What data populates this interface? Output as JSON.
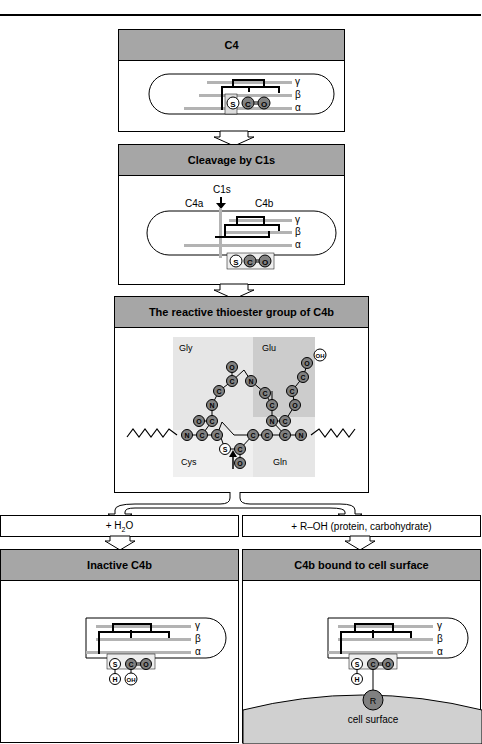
{
  "panels": {
    "c4": {
      "title": "C4"
    },
    "cleavage": {
      "title": "Cleavage by C1s",
      "labels": {
        "enzyme": "C1s",
        "fragment_a": "C4a",
        "fragment_b": "C4b"
      }
    },
    "thioester": {
      "title": "The reactive thioester group of C4b",
      "regions": {
        "gly": "Gly",
        "glu": "Glu",
        "cys": "Cys",
        "gln": "Gln"
      }
    },
    "inactive": {
      "title": "Inactive C4b"
    },
    "bound": {
      "title": "C4b bound to cell surface",
      "surface_label": "cell surface",
      "r_label": "R"
    }
  },
  "branches": {
    "left": {
      "label_prefix": "+ H",
      "label_sub": "2",
      "label_suffix": "O"
    },
    "right": {
      "label": "+ R–OH (protein, carbohydrate)"
    }
  },
  "chains": {
    "gamma": "γ",
    "beta": "β",
    "alpha": "α"
  },
  "atoms": {
    "S": "S",
    "C": "C",
    "O": "O",
    "H": "H",
    "OH": "OH",
    "N": "N"
  },
  "colors": {
    "header": "#a6a6a6",
    "atom_fill": "#808080",
    "shade_light": "#e6e6e6",
    "shade_mid": "#cccccc",
    "chain": "#b3b3b3"
  }
}
